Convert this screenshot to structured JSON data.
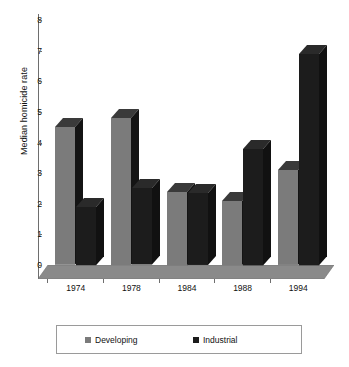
{
  "chart_data": {
    "type": "bar",
    "title": "",
    "subtitle": "",
    "xlabel": "",
    "ylabel": "Median homicide rate",
    "categories": [
      "1974",
      "1978",
      "1984",
      "1988",
      "1994"
    ],
    "series": [
      {
        "name": "Developing",
        "color": "#7b7b7b",
        "values": [
          4.5,
          4.8,
          2.4,
          2.1,
          3.1
        ]
      },
      {
        "name": "Industrial",
        "color": "#1c1c1c",
        "values": [
          1.9,
          2.5,
          2.35,
          3.8,
          6.9
        ]
      }
    ],
    "ylim": [
      0,
      8
    ],
    "yticks": [
      0,
      1,
      2,
      3,
      4,
      5,
      6,
      7,
      8
    ],
    "ytick_labels": [
      "0",
      "1",
      "2",
      "3",
      "4",
      "5",
      "6",
      "7",
      "8"
    ],
    "grid": false,
    "legend_position": "bottom",
    "render": "3d-columns"
  },
  "axis": {
    "y_title": "Median homicide rate",
    "tick_labels": [
      "8",
      "7",
      "6",
      "5",
      "4",
      "3",
      "2",
      "1",
      "0"
    ],
    "x_labels": [
      "1974",
      "1978",
      "1984",
      "1988",
      "1994"
    ]
  },
  "legend": {
    "entries": [
      {
        "label": "Developing",
        "color": "#7b7b7b"
      },
      {
        "label": "Industrial",
        "color": "#1c1c1c"
      }
    ]
  },
  "colors": {
    "developing": "#7b7b7b",
    "industrial": "#1c1c1c",
    "developing_top": "#3a3a3a",
    "industrial_top": "#2a2a2a",
    "developing_side": "#141414",
    "industrial_side": "#111111",
    "floor": "#8a8a8a",
    "axis": "#6e6e6e",
    "background": "#ffffff"
  }
}
